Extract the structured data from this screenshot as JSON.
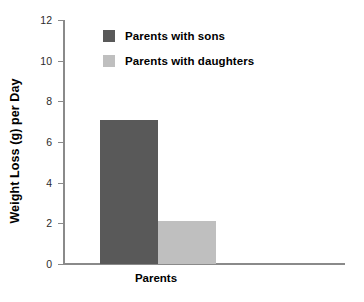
{
  "chart_data": {
    "type": "bar",
    "title": "",
    "xlabel": "Parents",
    "ylabel": "Weight Loss (g) per Day",
    "categories": [
      "Parents"
    ],
    "series": [
      {
        "name": "Parents with sons",
        "values": [
          7.1
        ],
        "color": "#595959"
      },
      {
        "name": "Parents with daughters",
        "values": [
          2.1
        ],
        "color": "#bfbfbf"
      }
    ],
    "ylim": [
      0,
      12
    ],
    "ytick_labels": [
      "12",
      "10",
      "8",
      "6",
      "4",
      "2",
      "0"
    ],
    "ytick_values": [
      12,
      10,
      8,
      6,
      4,
      2,
      0
    ],
    "ytick_step": 2,
    "grid": false,
    "legend_position": "inside-top-left",
    "axis_color": "#8a8a8a",
    "background": "#ffffff"
  },
  "legend": {
    "items": [
      {
        "label": "Parents with sons",
        "color": "#595959"
      },
      {
        "label": "Parents with daughters",
        "color": "#bfbfbf"
      }
    ]
  },
  "axes": {
    "y_title": "Weight Loss (g) per Day",
    "x_title": "Parents"
  }
}
